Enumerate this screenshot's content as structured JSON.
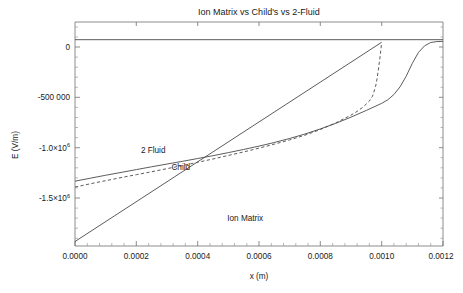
{
  "chart_data": {
    "type": "line",
    "title": "Ion Matrix vs Child's vs 2-Fluid",
    "xlabel": "x (m)",
    "ylabel": "E (V/m)",
    "xlim": [
      0.0,
      0.0012
    ],
    "ylim": [
      -1750000.0,
      150000
    ],
    "grid": false,
    "legend_position": "inline-annotations",
    "xticks": [
      0.0,
      0.0002,
      0.0004,
      0.0006,
      0.0008,
      0.001,
      0.0012
    ],
    "xticklabels": [
      "0.0000",
      "0.0002",
      "0.0004",
      "0.0006",
      "0.0008",
      "0.0010",
      "0.0012"
    ],
    "yticks": [
      0,
      -500000,
      -1000000,
      -1500000
    ],
    "yticklabels": [
      "0",
      "-500 000",
      "-1.0×10⁶",
      "-1.5×10⁶"
    ],
    "yticklabels_parts": [
      {
        "mantissa": "0",
        "exponent": ""
      },
      {
        "mantissa": "-500 000",
        "exponent": ""
      },
      {
        "mantissa": "-1.0×10",
        "exponent": "6"
      },
      {
        "mantissa": "-1.5×10",
        "exponent": "6"
      }
    ],
    "series": [
      {
        "name": "2 Fluid",
        "style": "solid",
        "color": "#4a4a4a",
        "annotation": "2 Fluid",
        "annotation_x": 0.000255,
        "annotation_y": -965000,
        "x": [
          0.0,
          5e-05,
          0.0001,
          0.00015,
          0.0002,
          0.00025,
          0.0003,
          0.00035,
          0.0004,
          0.00045,
          0.0005,
          0.00055,
          0.0006,
          0.00065,
          0.0007,
          0.00075,
          0.0008,
          0.00085,
          0.0009,
          0.00095,
          0.001,
          0.00102,
          0.00104,
          0.00106,
          0.00108,
          0.0011,
          0.00112,
          0.00114,
          0.00116,
          0.00118,
          0.0012
        ],
        "y": [
          -1200000,
          -1175000,
          -1150000,
          -1126000,
          -1102000,
          -1078000,
          -1055000,
          -1032000,
          -1008000,
          -984000,
          -958000,
          -931000,
          -903000,
          -872000,
          -838000,
          -800000,
          -757000,
          -710000,
          -657000,
          -600000,
          -540000,
          -510000,
          -465000,
          -400000,
          -310000,
          -200000,
          -108000,
          -52000,
          -24000,
          -16000,
          -14000
        ]
      },
      {
        "name": "Child",
        "style": "dashed",
        "color": "#4a4a4a",
        "annotation": "Child",
        "annotation_x": 0.000345,
        "annotation_y": -1105000,
        "x": [
          0.0,
          5e-05,
          0.0001,
          0.00015,
          0.0002,
          0.00025,
          0.0003,
          0.00035,
          0.0004,
          0.00045,
          0.0005,
          0.00055,
          0.0006,
          0.00065,
          0.0007,
          0.00075,
          0.0008,
          0.00085,
          0.0009,
          0.00092,
          0.00094,
          0.00096,
          0.00097,
          0.00098,
          0.000985,
          0.00099,
          0.000995,
          0.001
        ],
        "y": [
          -1250000,
          -1222000,
          -1196000,
          -1170000,
          -1145000,
          -1120000,
          -1094000,
          -1068000,
          -1040000,
          -1012000,
          -982000,
          -952000,
          -920000,
          -886000,
          -850000,
          -810000,
          -762000,
          -706000,
          -640000,
          -608000,
          -570000,
          -520000,
          -480000,
          -400000,
          -330000,
          -240000,
          -140000,
          -25000
        ]
      },
      {
        "name": "Ion Matrix",
        "style": "solid",
        "color": "#4a4a4a",
        "annotation": "Ion Matrix",
        "annotation_x": 0.000555,
        "annotation_y": -1535000,
        "x": [
          0.0,
          0.001
        ],
        "y": [
          -1712000,
          -22000
        ]
      },
      {
        "name": "zero-line",
        "style": "solid",
        "color": "#4a4a4a",
        "annotation": "",
        "x": [
          0.0,
          0.0012
        ],
        "y": [
          0,
          0
        ]
      }
    ]
  },
  "axes": {
    "y_axis_title": "E (V/m)",
    "x_axis_title": "x (m)"
  }
}
